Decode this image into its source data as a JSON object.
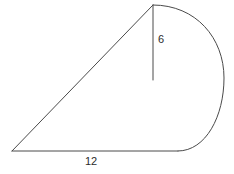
{
  "figure": {
    "background_color": "#ffffff",
    "stroke_color": "#4a4a4a",
    "stroke_width": 1,
    "text_color": "#2b2b2b",
    "labels": {
      "height": "6",
      "base": "12"
    },
    "geometry": {
      "apex": [
        153,
        5
      ],
      "left_vertex": [
        12,
        151
      ],
      "arc_base_junction": [
        178,
        151
      ],
      "height_segment_end": [
        153,
        80
      ],
      "arc_rightmost_x": 224,
      "arc_rightmost_y": 78
    },
    "paths": {
      "base_line": "M 12 151 L 178 151",
      "hypotenuse": "M 12 151 L 153 5",
      "height_segment": "M 153 5 L 153 80",
      "arc": "M 153 5 C 196 5 224 38 224 78 C 224 116 206 151 178 151"
    }
  }
}
